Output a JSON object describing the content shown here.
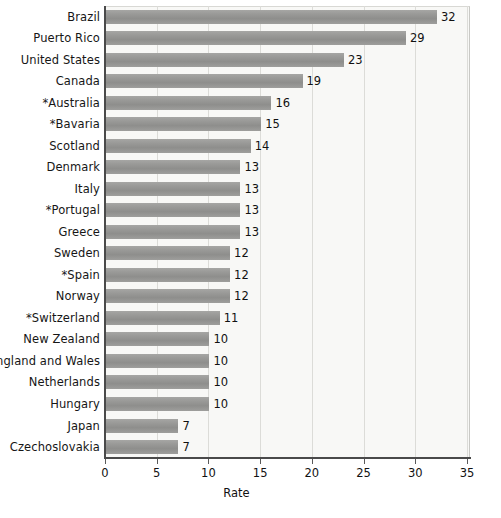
{
  "chart_data": {
    "type": "bar",
    "orientation": "horizontal",
    "title": "",
    "xlabel": "Rate",
    "ylabel": "",
    "xlim": [
      0,
      35
    ],
    "xticks": [
      0,
      5,
      10,
      15,
      20,
      25,
      30,
      35
    ],
    "grid": true,
    "legend": null,
    "categories": [
      "Brazil",
      "Puerto Rico",
      "United States",
      "Canada",
      "*Australia",
      "*Bavaria",
      "Scotland",
      "Denmark",
      "Italy",
      "*Portugal",
      "Greece",
      "Sweden",
      "*Spain",
      "Norway",
      "*Switzerland",
      "New Zealand",
      "England and Wales",
      "Netherlands",
      "Hungary",
      "Japan",
      "Czechoslovakia"
    ],
    "values": [
      32,
      29,
      23,
      19,
      16,
      15,
      14,
      13,
      13,
      13,
      13,
      12,
      12,
      12,
      11,
      10,
      10,
      10,
      10,
      7,
      7
    ],
    "data_labels": [
      "32",
      "29",
      "23",
      "19",
      "16",
      "15",
      "14",
      "13",
      "13",
      "13",
      "13",
      "12",
      "12",
      "12",
      "11",
      "10",
      "10",
      "10",
      "10",
      "7",
      "7"
    ],
    "colors": {
      "bar": "#949492",
      "plot_background": "#f8f8f6",
      "gridline": "#dcdcd8",
      "axis": "#4a4a4a",
      "text": "#111111"
    }
  }
}
